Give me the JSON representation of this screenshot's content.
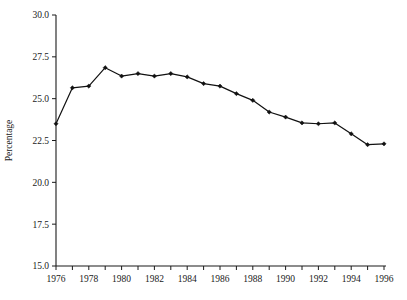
{
  "chart_data": {
    "type": "line",
    "title": "",
    "xlabel": "",
    "ylabel": "Percentage",
    "x": [
      1976,
      1977,
      1978,
      1979,
      1980,
      1981,
      1982,
      1983,
      1984,
      1985,
      1986,
      1987,
      1988,
      1989,
      1990,
      1991,
      1992,
      1993,
      1994,
      1995,
      1996
    ],
    "values": [
      23.5,
      25.65,
      25.75,
      26.85,
      26.35,
      26.5,
      26.35,
      26.5,
      26.3,
      25.9,
      25.75,
      25.3,
      24.9,
      24.2,
      23.9,
      23.55,
      23.5,
      23.55,
      22.9,
      22.25,
      22.3
    ],
    "series": [
      {
        "name": "Percentage",
        "values": [
          23.5,
          25.65,
          25.75,
          26.85,
          26.35,
          26.5,
          26.35,
          26.5,
          26.3,
          25.9,
          25.75,
          25.3,
          24.9,
          24.2,
          23.9,
          23.55,
          23.5,
          23.55,
          22.9,
          22.25,
          22.3
        ]
      }
    ],
    "ylim": [
      15.0,
      30.0
    ],
    "xlim": [
      1976,
      1996
    ],
    "ytick_labels": [
      "15.0",
      "17.5",
      "20.0",
      "22.5",
      "25.0",
      "27.5",
      "30.0"
    ],
    "ytick_values": [
      15.0,
      17.5,
      20.0,
      22.5,
      25.0,
      27.5,
      30.0
    ],
    "xtick_values": [
      1976,
      1977,
      1978,
      1979,
      1980,
      1981,
      1982,
      1983,
      1984,
      1985,
      1986,
      1987,
      1988,
      1989,
      1990,
      1991,
      1992,
      1993,
      1994,
      1995,
      1996
    ],
    "xtick_labels": [
      "1976",
      "",
      "1978",
      "",
      "1980",
      "",
      "1982",
      "",
      "1984",
      "",
      "1986",
      "",
      "1988",
      "",
      "1990",
      "",
      "1992",
      "",
      "1994",
      "",
      "1996"
    ],
    "grid": false,
    "legend": "none",
    "marker": "filled-diamond",
    "line_color": "#111111",
    "axis_color": "#1a1a1a",
    "background_color": "#ffffff"
  }
}
